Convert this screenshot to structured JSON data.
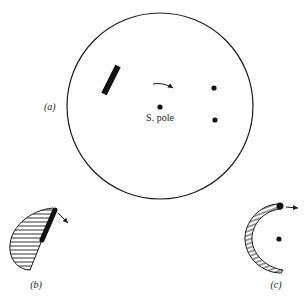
{
  "figure": {
    "panels": [
      {
        "id": "a",
        "label": "(a)",
        "pole_label": "S. pole"
      },
      {
        "id": "b",
        "label": "(b)"
      },
      {
        "id": "c",
        "label": "(c)"
      }
    ],
    "colors": {
      "ink": "#1a1a1a",
      "background": "#ffffff"
    }
  }
}
